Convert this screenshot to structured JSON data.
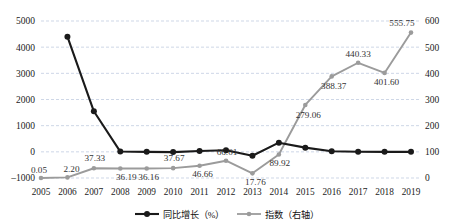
{
  "chart_data": {
    "type": "line",
    "title": "",
    "xlabel": "",
    "ylabel": "",
    "y2label": "",
    "grid": true,
    "legend_position": "bottom",
    "categories": [
      "2005",
      "2006",
      "2007",
      "2008",
      "2009",
      "2010",
      "2011",
      "2012",
      "2013",
      "2014",
      "2015",
      "2016",
      "2017",
      "2018",
      "2019"
    ],
    "ylim": [
      -1000,
      5000
    ],
    "yticks": [
      "-1000",
      "0",
      "1000",
      "2000",
      "3000",
      "4000",
      "5000"
    ],
    "y2lim": [
      0,
      600
    ],
    "y2ticks": [
      "0",
      "100",
      "200",
      "300",
      "400",
      "500",
      "600"
    ],
    "series": [
      {
        "name": "同比增长（%）",
        "axis": "left",
        "color": "#1a1a1a",
        "marker": "circle",
        "values": [
          null,
          4400,
          1550,
          10,
          0,
          -10,
          30,
          60,
          -150,
          350,
          160,
          20,
          5,
          0,
          0
        ],
        "labels": [
          "",
          "",
          "",
          "",
          "",
          "",
          "",
          "",
          "",
          "",
          "",
          "",
          "",
          "",
          ""
        ]
      },
      {
        "name": "指数（右轴）",
        "axis": "right",
        "color": "#9b9b9b",
        "marker": "circle",
        "values": [
          0.05,
          2.2,
          37.33,
          36.19,
          36.16,
          37.67,
          46.66,
          66.01,
          17.76,
          89.92,
          279.06,
          388.37,
          440.33,
          401.6,
          555.75
        ],
        "labels": [
          "0.05",
          "2.20",
          "37.33",
          "36.19",
          "36.16",
          "37.67",
          "46.66",
          "66.01",
          "17.76",
          "89.92",
          "279.06",
          "388.37",
          "440.33",
          "401.60",
          "555.75"
        ]
      }
    ]
  },
  "legend": {
    "items": [
      {
        "label": "同比增长（%）",
        "color": "#1a1a1a"
      },
      {
        "label": "指数（右轴）",
        "color": "#9b9b9b"
      }
    ]
  }
}
